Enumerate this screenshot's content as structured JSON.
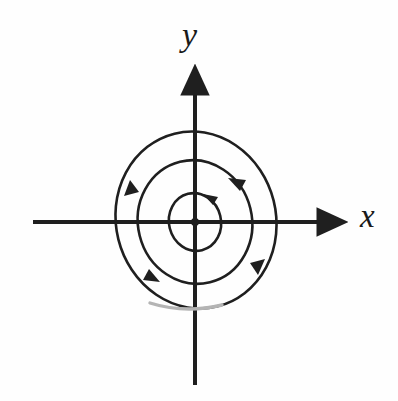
{
  "figure": {
    "kind": "phase-portrait",
    "title": "",
    "background_color": "#fefefe",
    "stroke_color": "#1f1f1f",
    "faded_stroke_color": "#9a9a9a"
  },
  "axes": {
    "x_label": "x",
    "y_label": "y",
    "origin": {
      "x": 195,
      "y": 222
    },
    "x_axis": {
      "start_x": 33,
      "end_x": 348,
      "y": 222,
      "arrow": "right"
    },
    "y_axis": {
      "x": 195,
      "start_y": 385,
      "end_y": 63,
      "arrow": "up"
    }
  },
  "equilibrium": {
    "name": "center",
    "marker": "filled-dot",
    "x": 195,
    "y": 222,
    "radius": 4
  },
  "chart_data": {
    "type": "line",
    "xlabel": "x",
    "ylabel": "y",
    "grid": false,
    "legend": "none",
    "xlim": [
      -195,
      203
    ],
    "ylim": [
      -179,
      222
    ],
    "annotations": [
      "center at origin",
      "counterclockwise closed orbits"
    ],
    "series": [
      {
        "name": "inner-orbit",
        "kind": "closed-orbit",
        "direction": "counterclockwise",
        "center": [
          195,
          222
        ],
        "rx": 26,
        "ry": 29,
        "rotation_deg": -14,
        "arrow_angle_deg": 300
      },
      {
        "name": "middle-orbit",
        "kind": "closed-orbit",
        "direction": "counterclockwise",
        "center": [
          195,
          222
        ],
        "rx": 57,
        "ry": 62,
        "rotation_deg": -14,
        "arrow_angle_deg": 305
      },
      {
        "name": "outer-orbit",
        "kind": "closed-orbit",
        "direction": "counterclockwise",
        "center": [
          196,
          220
        ],
        "rx": 80,
        "ry": 89,
        "rotation_deg": -14,
        "arrow_angle_deg": 132
      }
    ]
  }
}
